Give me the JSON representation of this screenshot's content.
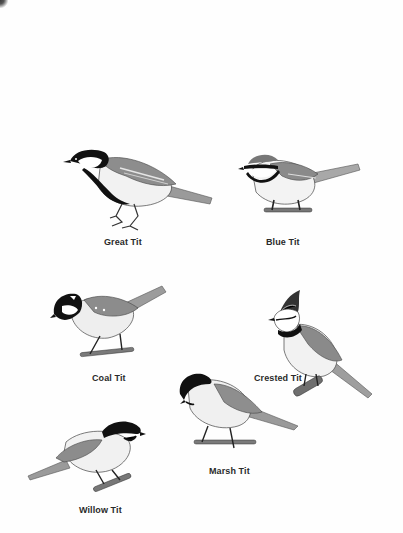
{
  "page": {
    "background": "#ffffff",
    "ink": "#1a1a1a"
  },
  "birds": [
    {
      "name": "Great Tit",
      "icon": "great-tit-illustration"
    },
    {
      "name": "Blue Tit",
      "icon": "blue-tit-illustration"
    },
    {
      "name": "Coal Tit",
      "icon": "coal-tit-illustration"
    },
    {
      "name": "Crested Tit",
      "icon": "crested-tit-illustration"
    },
    {
      "name": "Marsh Tit",
      "icon": "marsh-tit-illustration"
    },
    {
      "name": "Willow Tit",
      "icon": "willow-tit-illustration"
    }
  ]
}
